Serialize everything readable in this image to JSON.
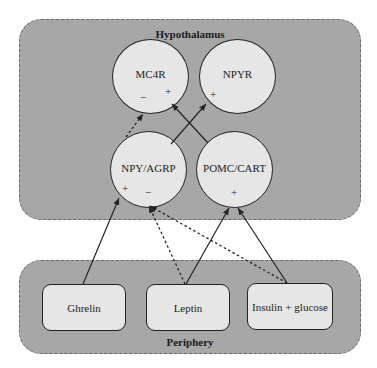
{
  "panels": {
    "hypothalamus": {
      "title": "Hypothalamus"
    },
    "periphery": {
      "title": "Periphery"
    }
  },
  "nodes": {
    "mc4r": {
      "label": "MC4R",
      "signs": [
        "−",
        "+"
      ]
    },
    "npyr": {
      "label": "NPYR",
      "signs": [
        "+"
      ]
    },
    "npy_agrp": {
      "label": "NPY/AGRP",
      "signs": [
        "+",
        "−"
      ]
    },
    "pomc_cart": {
      "label": "POMC/CART",
      "signs": [
        "+"
      ]
    },
    "ghrelin": {
      "label": "Ghrelin"
    },
    "leptin": {
      "label": "Leptin"
    },
    "insulin_glucose": {
      "label": "Insulin + glucose"
    }
  },
  "edges": [
    {
      "from": "NPY/AGRP",
      "to": "MC4R (−)",
      "style": "dashed"
    },
    {
      "from": "POMC/CART",
      "to": "MC4R (+)",
      "style": "solid"
    },
    {
      "from": "NPY/AGRP",
      "to": "NPYR (+)",
      "style": "solid"
    },
    {
      "from": "Ghrelin",
      "to": "NPY/AGRP (+)",
      "style": "solid"
    },
    {
      "from": "Leptin",
      "to": "NPY/AGRP (−)",
      "style": "dashed"
    },
    {
      "from": "Insulin + glucose",
      "to": "NPY/AGRP (−)",
      "style": "dashed"
    },
    {
      "from": "Leptin",
      "to": "POMC/CART (+)",
      "style": "solid"
    },
    {
      "from": "Insulin + glucose",
      "to": "POMC/CART (+)",
      "style": "solid"
    }
  ],
  "colors": {
    "panel": "#a7a7a7",
    "node": "#e6e6e6",
    "stroke": "#222222"
  }
}
